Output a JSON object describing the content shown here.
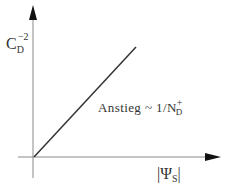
{
  "diagram": {
    "y_axis_label": {
      "base": "C",
      "subscript": "D",
      "superscript": "−2"
    },
    "x_axis_label": {
      "open_bar": "|",
      "base": "Ψ",
      "subscript": "S",
      "close_bar": "|"
    },
    "slope_annotation": {
      "text": "Anstieg",
      "relation": "~",
      "numerator": "1/N",
      "n_superscript": "+",
      "n_subscript": "D"
    },
    "colors": {
      "axis": "#888888",
      "line": "#333333",
      "text": "#333333"
    },
    "line": {
      "from": [
        34,
        157
      ],
      "to": [
        136,
        47
      ]
    },
    "x_axis": {
      "y": 157,
      "from": 18,
      "to": 220
    },
    "y_axis": {
      "x": 33,
      "from": 178,
      "to": 5
    }
  }
}
